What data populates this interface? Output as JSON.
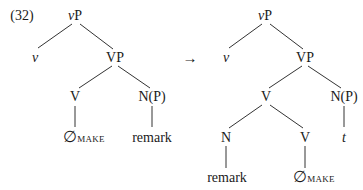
{
  "example_number": "(32)",
  "arrow": "→",
  "left_tree": {
    "root": {
      "head": "v",
      "suffix": "P"
    },
    "v": "v",
    "vp": "VP",
    "v_head": "V",
    "np": "N(P)",
    "null_symbol": "∅",
    "null_subscript": "MAKE",
    "remark": "remark"
  },
  "right_tree": {
    "root": {
      "head": "v",
      "suffix": "P"
    },
    "v": "v",
    "vp": "VP",
    "v_complex": "V",
    "np": "N(P)",
    "n": "N",
    "v_lower": "V",
    "trace": "t",
    "remark": "remark",
    "null_symbol": "∅",
    "null_subscript": "MAKE"
  }
}
